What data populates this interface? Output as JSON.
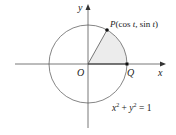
{
  "diagram": {
    "type": "unit-circle",
    "labels": {
      "y_axis": "y",
      "x_axis": "x",
      "origin": "O",
      "point_q": "Q",
      "point_p": "P(cos t, sin t)",
      "equation": "x² + y² = 1"
    },
    "colors": {
      "line": "#555555",
      "sector_fill": "#ececec",
      "point": "#111111"
    }
  }
}
